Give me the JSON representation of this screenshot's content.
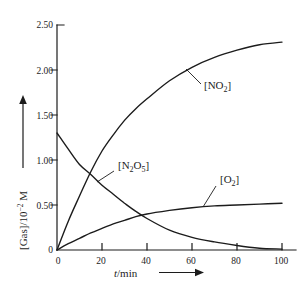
{
  "figure": {
    "background": "#ffffff",
    "ink": "#1c1c1c"
  },
  "axes": {
    "y_ticks": [
      "0",
      "0.50",
      "1.00",
      "1.50",
      "2.00",
      "2.50"
    ],
    "x_ticks": [
      "0",
      "20",
      "40",
      "60",
      "80",
      "100"
    ],
    "y_label": {
      "pre": "[Gas]/10",
      "sup": "−2",
      "post": " M"
    },
    "x_label": {
      "var": "t",
      "rest": "/min"
    }
  },
  "curve_labels": {
    "no2": {
      "p1": "[NO",
      "s1": "2",
      "p2": "]"
    },
    "n2o5": {
      "p1": "[N",
      "s1": "2",
      "p2": "O",
      "s2": "5",
      "p3": "]"
    },
    "o2": {
      "p1": "[O",
      "s1": "2",
      "p2": "]"
    }
  },
  "chart_data": {
    "type": "line",
    "title": "",
    "xlabel": "t/min",
    "ylabel": "[Gas]/10^-2 M",
    "xlim": [
      0,
      100
    ],
    "ylim": [
      0,
      2.5
    ],
    "x_tick_step": 20,
    "y_tick_step": 0.5,
    "grid": false,
    "legend_position": "inline-labels",
    "x": [
      0,
      5,
      10,
      15,
      20,
      25,
      30,
      35,
      40,
      50,
      60,
      70,
      80,
      90,
      100
    ],
    "series": [
      {
        "id": "no2",
        "name": "[NO2]",
        "values": [
          0,
          0.32,
          0.6,
          0.87,
          1.1,
          1.28,
          1.44,
          1.57,
          1.68,
          1.88,
          2.03,
          2.14,
          2.22,
          2.28,
          2.31
        ]
      },
      {
        "id": "n2o5",
        "name": "[N2O5]",
        "values": [
          1.3,
          1.12,
          0.95,
          0.84,
          0.72,
          0.62,
          0.52,
          0.43,
          0.35,
          0.22,
          0.14,
          0.09,
          0.05,
          0.02,
          0.01
        ]
      },
      {
        "id": "o2",
        "name": "[O2]",
        "values": [
          0,
          0.07,
          0.13,
          0.19,
          0.24,
          0.29,
          0.33,
          0.37,
          0.4,
          0.44,
          0.47,
          0.49,
          0.5,
          0.51,
          0.52
        ]
      }
    ]
  }
}
